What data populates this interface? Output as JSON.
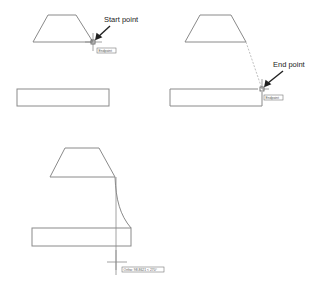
{
  "panels": [
    {
      "id": "start",
      "callout": "Start point",
      "tooltip": "Endpoint"
    },
    {
      "id": "end",
      "callout": "End point",
      "tooltip": "Endpoint"
    },
    {
      "id": "ortho",
      "tooltip": "Ortho: 98.8621 < 270°"
    }
  ],
  "colors": {
    "line": "#8a8a8a",
    "text": "#222222"
  }
}
